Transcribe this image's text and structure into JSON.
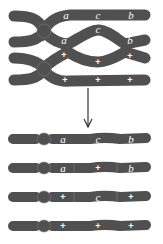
{
  "diagram": {
    "title": "",
    "colors": {
      "chromatid": "#505050",
      "label": "#ffffff",
      "arrow": "#222222",
      "background": "#ffffff"
    },
    "before": {
      "description": "Homologous chromosomes paired with a crossover between genes a and b",
      "chromatids": [
        {
          "labels": [
            "a",
            "c",
            "b"
          ]
        },
        {
          "labels": [
            "a",
            "c",
            "b"
          ]
        },
        {
          "labels": [
            "+",
            "+",
            "+"
          ]
        },
        {
          "labels": [
            "+",
            "+",
            "+"
          ]
        }
      ]
    },
    "arrow": "down-arrow",
    "after": {
      "description": "Resulting chromatids after double crossover",
      "chromatids": [
        {
          "labels": [
            "a",
            "c",
            "b"
          ]
        },
        {
          "labels": [
            "a",
            "+",
            "b"
          ]
        },
        {
          "labels": [
            "+",
            "c",
            "+"
          ]
        },
        {
          "labels": [
            "+",
            "+",
            "+"
          ]
        }
      ]
    }
  }
}
